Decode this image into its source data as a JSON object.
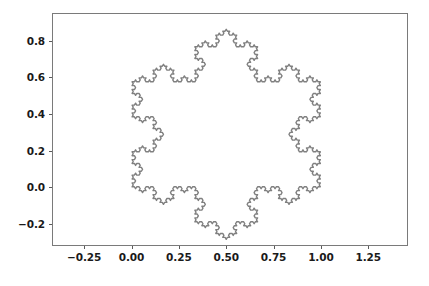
{
  "figure": {
    "background_color": "#ffffff",
    "axes_edge_color": "#7a7a7a",
    "tick_color": "#5a5a5a",
    "tick_label_color": "#1a1a1a"
  },
  "chart_data": {
    "type": "line",
    "title": "",
    "xlabel": "",
    "ylabel": "",
    "subtitle": "",
    "grid": false,
    "legend": null,
    "line_color": "#808080",
    "line_width": 1.4,
    "curve_name": "koch-snowflake",
    "iterations": 4,
    "base_triangle": [
      [
        0.0,
        0.0
      ],
      [
        1.0,
        0.0
      ],
      [
        0.5,
        0.8660254
      ]
    ],
    "closed": true,
    "xlim": [
      -0.42,
      1.46
    ],
    "ylim": [
      -0.32,
      0.95
    ],
    "xticks": [
      -0.25,
      0.0,
      0.25,
      0.5,
      0.75,
      1.0,
      1.25
    ],
    "xtick_labels": [
      "−0.25",
      "0.00",
      "0.25",
      "0.50",
      "0.75",
      "1.00",
      "1.25"
    ],
    "yticks": [
      -0.2,
      0.0,
      0.2,
      0.4,
      0.6,
      0.8
    ],
    "ytick_labels": [
      "−0.2",
      "0.0",
      "0.2",
      "0.4",
      "0.6",
      "0.8"
    ],
    "data_extent": {
      "x_min": -0.0192,
      "x_max": 1.0192,
      "y_min": -0.2837,
      "y_max": 0.9071
    },
    "annotations": []
  }
}
